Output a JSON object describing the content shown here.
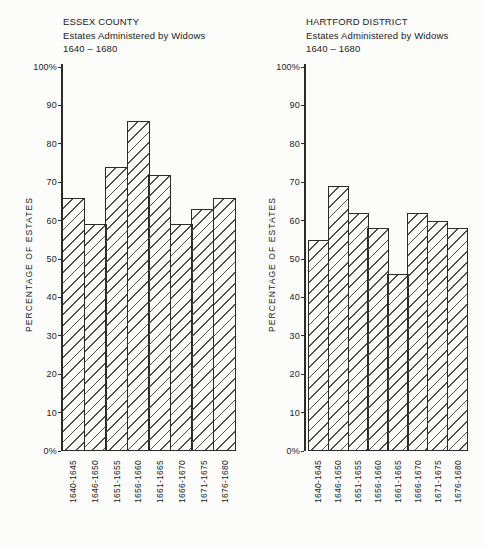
{
  "colors": {
    "ink": "#2b2b2b",
    "hatch_line": "#4f4f4f",
    "background": "#fcfcfa"
  },
  "chart_data": [
    {
      "type": "bar",
      "title": "ESSEX COUNTY",
      "subtitle": "Estates Administered by Widows",
      "period": "1640 – 1680",
      "ylabel": "PERCENTAGE OF ESTATES",
      "xlabel": "",
      "ylim": [
        0,
        100
      ],
      "grid": false,
      "legend": "none",
      "bar_fill": "diagonal-hatch",
      "ytick_labels": [
        "100%",
        "90",
        "80",
        "70",
        "60",
        "50",
        "40",
        "30",
        "20",
        "10",
        "0%"
      ],
      "ytick_values": [
        100,
        90,
        80,
        70,
        60,
        50,
        40,
        30,
        20,
        10,
        0
      ],
      "categories": [
        "1640-1645",
        "1646-1650",
        "1651-1655",
        "1656-1660",
        "1661-1665",
        "1666-1670",
        "1671-1675",
        "1676-1680"
      ],
      "values": [
        66,
        59,
        74,
        86,
        72,
        59,
        63,
        66
      ]
    },
    {
      "type": "bar",
      "title": "HARTFORD DISTRICT",
      "subtitle": "Estates Administered by Widows",
      "period": "1640 – 1680",
      "ylabel": "PERCENTAGE OF ESTATES",
      "xlabel": "",
      "ylim": [
        0,
        100
      ],
      "grid": false,
      "legend": "none",
      "bar_fill": "diagonal-hatch",
      "ytick_labels": [
        "100%",
        "90",
        "80",
        "70",
        "60",
        "50",
        "40",
        "30",
        "20",
        "10",
        "0%"
      ],
      "ytick_values": [
        100,
        90,
        80,
        70,
        60,
        50,
        40,
        30,
        20,
        10,
        0
      ],
      "categories": [
        "1640-1645",
        "1646-1650",
        "1651-1655",
        "1656-1660",
        "1661-1665",
        "1666-1670",
        "1671-1675",
        "1676-1680"
      ],
      "values": [
        55,
        69,
        62,
        58,
        46,
        62,
        60,
        58
      ]
    }
  ]
}
